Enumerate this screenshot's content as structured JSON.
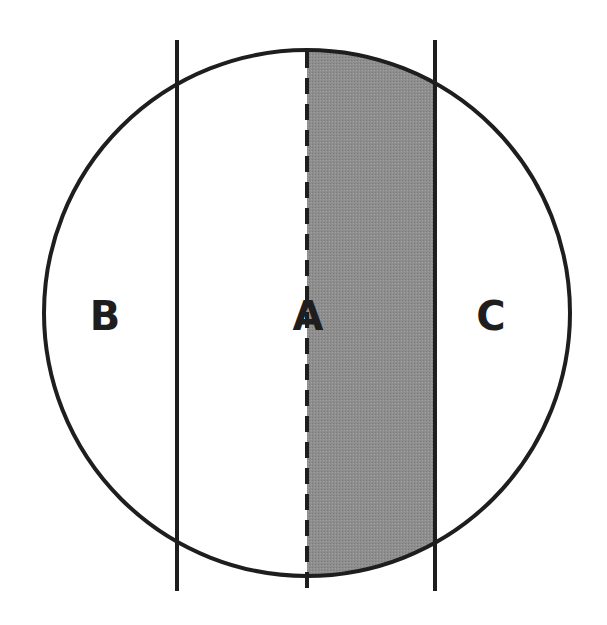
{
  "diagram": {
    "circle": {
      "cx": 307,
      "cy": 313,
      "r": 263
    },
    "lines": [
      {
        "name": "left-line",
        "x": 177,
        "style": "solid"
      },
      {
        "name": "center-line",
        "x": 307,
        "style": "dashed"
      },
      {
        "name": "right-line",
        "x": 435,
        "style": "solid"
      }
    ],
    "shaded_region": {
      "between": [
        "center-line",
        "right-line"
      ],
      "color": "#8c8c8c"
    },
    "labels": {
      "left": "B",
      "center": "A",
      "right": "C"
    },
    "colors": {
      "stroke": "#1e1e1e",
      "fill": "#8c8c8c",
      "background": "#ffffff"
    }
  }
}
